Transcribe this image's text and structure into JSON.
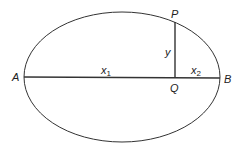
{
  "diagram": {
    "type": "ellipse-geometry",
    "labels": {
      "A": "A",
      "B": "B",
      "P": "P",
      "Q": "Q",
      "y": "y",
      "x1": "x",
      "x1_sub": "1",
      "x2": "x",
      "x2_sub": "2"
    },
    "colors": {
      "stroke": "#333333",
      "text": "#222222",
      "background": "#ffffff"
    }
  }
}
